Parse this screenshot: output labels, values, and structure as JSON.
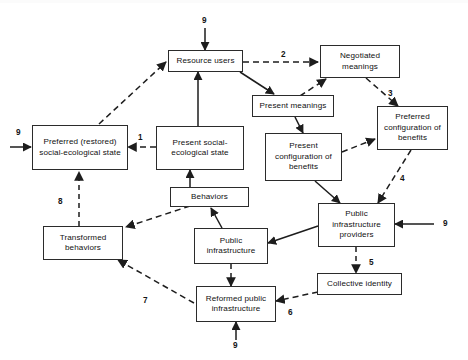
{
  "diagram": {
    "background": "#ffffff",
    "stroke_color": "#2b2b2b",
    "text_color": "#111111",
    "nodes": [
      {
        "id": "resource_users",
        "label": "Resource users"
      },
      {
        "id": "negotiated_meanings",
        "label": "Negotiated meanings"
      },
      {
        "id": "present_meanings",
        "label": "Present meanings"
      },
      {
        "id": "preferred_config",
        "label": "Preferred configuration of benefits"
      },
      {
        "id": "present_config",
        "label": "Present configuration of benefits"
      },
      {
        "id": "preferred_state",
        "label": "Preferred (restored) social-ecological state"
      },
      {
        "id": "present_state",
        "label": "Present social-ecological state"
      },
      {
        "id": "behaviors",
        "label": "Behaviors"
      },
      {
        "id": "public_infra",
        "label": "Public infrastructure"
      },
      {
        "id": "infra_providers",
        "label": "Public infrastructure providers"
      },
      {
        "id": "collective_identity",
        "label": "Collective identity"
      },
      {
        "id": "transformed_behaviors",
        "label": "Transformed behaviors"
      },
      {
        "id": "reformed_infra",
        "label": "Reformed public infrastructure"
      }
    ],
    "edge_labels": [
      {
        "id": "label-9-top",
        "text": "9"
      },
      {
        "id": "label-2",
        "text": "2"
      },
      {
        "id": "label-3",
        "text": "3"
      },
      {
        "id": "label-9-left",
        "text": "9"
      },
      {
        "id": "label-1",
        "text": "1"
      },
      {
        "id": "label-4",
        "text": "4"
      },
      {
        "id": "label-9-right",
        "text": "9"
      },
      {
        "id": "label-8",
        "text": "8"
      },
      {
        "id": "label-5",
        "text": "5"
      },
      {
        "id": "label-7",
        "text": "7"
      },
      {
        "id": "label-6",
        "text": "6"
      },
      {
        "id": "label-9-bottom",
        "text": "9"
      }
    ]
  }
}
